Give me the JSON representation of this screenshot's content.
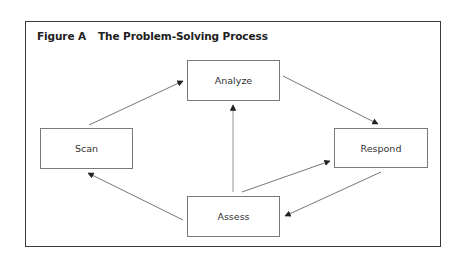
{
  "figure": {
    "label": "Figure A",
    "title": "The Problem-Solving Process"
  },
  "nodes": {
    "analyze": "Analyze",
    "scan": "Scan",
    "respond": "Respond",
    "assess": "Assess"
  },
  "edges": [
    {
      "from": "Scan",
      "to": "Analyze"
    },
    {
      "from": "Analyze",
      "to": "Respond"
    },
    {
      "from": "Assess",
      "to": "Analyze"
    },
    {
      "from": "Assess",
      "to": "Respond"
    },
    {
      "from": "Respond",
      "to": "Assess"
    },
    {
      "from": "Assess",
      "to": "Scan"
    }
  ],
  "colors": {
    "frame": "#3a3a3a",
    "box_border": "#7a7a7a",
    "arrow": "#555555",
    "text": "#333333"
  }
}
